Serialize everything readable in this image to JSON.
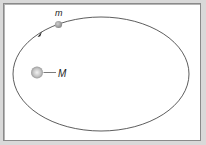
{
  "diagram": {
    "labels": {
      "small_mass": "m",
      "large_mass": "M"
    },
    "orbit": {
      "cx": 101,
      "cy": 74,
      "rx": 88,
      "ry": 57,
      "direction": "counterclockwise"
    },
    "colors": {
      "background": "#d9d9d9",
      "panel": "#ffffff",
      "orbit_line": "#333333",
      "small_mass": "#9a9a9a",
      "large_mass": "#b0b0b0"
    }
  }
}
